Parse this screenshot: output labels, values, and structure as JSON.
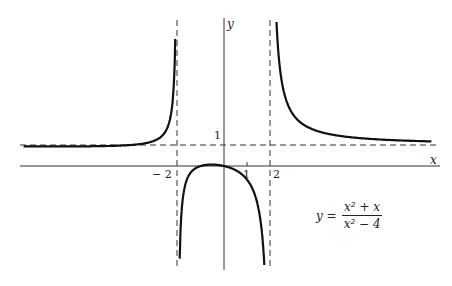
{
  "chart_data": {
    "type": "line",
    "title": "",
    "function": "y = (x^2 + x)/(x^2 - 4)",
    "formula": {
      "lhs": "y =",
      "numerator": "x² + x",
      "denominator": "x² − 4"
    },
    "xlabel": "x",
    "ylabel": "y",
    "x_ticks": [
      "−2",
      "1",
      "2"
    ],
    "y_ticks": [
      "1"
    ],
    "asymptotes": {
      "vertical": [
        -2,
        2
      ],
      "horizontal": [
        1
      ]
    },
    "xlim": [
      -9,
      9
    ],
    "ylim": [
      -5,
      6.5
    ],
    "grid": false,
    "legend": null
  },
  "labels": {
    "x_axis": "x",
    "y_axis": "y",
    "tick_m2": "− 2",
    "tick_1": "1",
    "tick_2": "2",
    "tick_y1": "1"
  },
  "formula": {
    "lhs": "y =",
    "numerator": "x² + x",
    "denominator": "x² − 4"
  }
}
